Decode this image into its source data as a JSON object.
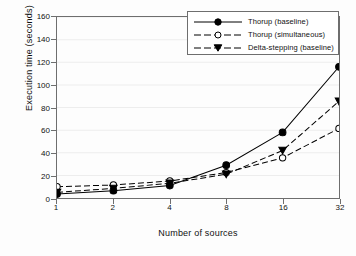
{
  "chart_data": {
    "type": "line",
    "title": "",
    "xlabel": "Number of sources",
    "ylabel": "Execution time (seconds)",
    "x": [
      1,
      2,
      4,
      8,
      16,
      32
    ],
    "xticklabels": [
      "1",
      "2",
      "4",
      "8",
      "16",
      "32"
    ],
    "xscale": "log2",
    "yticklabels": [
      "0",
      "20",
      "40",
      "60",
      "80",
      "100",
      "120",
      "140",
      "160"
    ],
    "yticks": [
      0,
      20,
      40,
      60,
      80,
      100,
      120,
      140,
      160
    ],
    "ylim": [
      0,
      160
    ],
    "grid": "faint-horizontal",
    "legend_position": "top-right",
    "series": [
      {
        "name": "Thorup (baseline)",
        "marker": "filled-circle",
        "linestyle": "solid",
        "color": "#000000",
        "values": [
          3.5,
          6.5,
          11.0,
          29.0,
          58.0,
          116.0
        ]
      },
      {
        "name": "Thorup (simultaneous)",
        "marker": "open-circle",
        "linestyle": "dashed",
        "color": "#000000",
        "values": [
          10.0,
          11.5,
          15.0,
          22.5,
          35.5,
          61.5
        ]
      },
      {
        "name": "Delta-stepping (baseline)",
        "marker": "filled-triangle-down",
        "linestyle": "dashed",
        "color": "#000000",
        "values": [
          5.0,
          8.5,
          13.0,
          21.0,
          42.0,
          85.5
        ]
      }
    ]
  },
  "axes": {
    "ylabel": "Execution time (seconds)",
    "xlabel": "Number of sources",
    "yticks": [
      "0",
      "20",
      "40",
      "60",
      "80",
      "100",
      "120",
      "140",
      "160"
    ],
    "xticks": [
      "1",
      "2",
      "4",
      "8",
      "16",
      "32"
    ]
  },
  "legend": {
    "entries": [
      {
        "label": "Thorup (baseline)",
        "marker": "filled-circle",
        "linestyle": "solid"
      },
      {
        "label": "Thorup (simultaneous)",
        "marker": "open-circle",
        "linestyle": "dashed"
      },
      {
        "label": "Delta-stepping (baseline)",
        "marker": "filled-triangle-down",
        "linestyle": "dashed"
      }
    ]
  },
  "style": {
    "axis_color": "#6e6e6e",
    "line_color": "#000000",
    "grid_color": "#ededed",
    "background": "#fdfdfd"
  }
}
